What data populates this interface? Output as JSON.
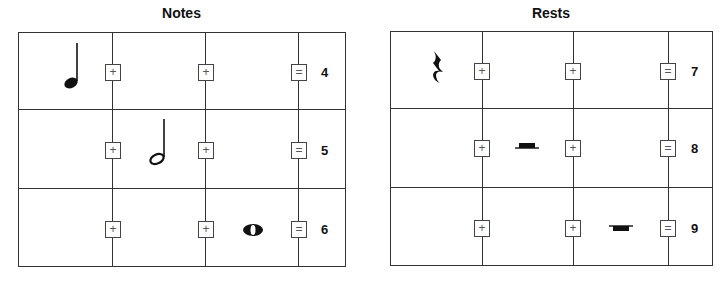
{
  "panels": [
    {
      "title": "Notes",
      "rows": [
        {
          "symbols": [
            {
              "name": "quarter-note",
              "col": 0
            }
          ],
          "operators": [
            "+",
            "+",
            "="
          ],
          "answer": "4"
        },
        {
          "symbols": [
            {
              "name": "half-note",
              "col": 1
            }
          ],
          "operators": [
            "+",
            "+",
            "="
          ],
          "answer": "5"
        },
        {
          "symbols": [
            {
              "name": "whole-note",
              "col": 2
            }
          ],
          "operators": [
            "+",
            "+",
            "="
          ],
          "answer": "6"
        }
      ]
    },
    {
      "title": "Rests",
      "rows": [
        {
          "symbols": [
            {
              "name": "quarter-rest",
              "col": 0
            }
          ],
          "operators": [
            "+",
            "+",
            "="
          ],
          "answer": "7"
        },
        {
          "symbols": [
            {
              "name": "half-rest",
              "col": 1
            }
          ],
          "operators": [
            "+",
            "+",
            "="
          ],
          "answer": "8"
        },
        {
          "symbols": [
            {
              "name": "whole-rest",
              "col": 2
            }
          ],
          "operators": [
            "+",
            "+",
            "="
          ],
          "answer": "9"
        }
      ]
    }
  ],
  "colors": {
    "line": "#333333",
    "ink": "#111111"
  }
}
